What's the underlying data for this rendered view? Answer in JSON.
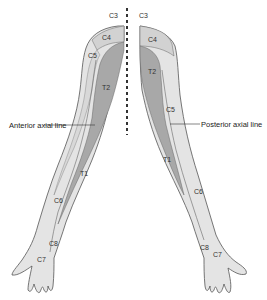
{
  "figure": {
    "colors": {
      "light": "#e4e4e4",
      "medium": "#c9c9c9",
      "dark": "#a8a8a8",
      "outline": "#555555",
      "divider": "#333333"
    },
    "annotations": {
      "anterior_axial_line": "Anterior axial line",
      "posterior_axial_line": "Posterior axial line"
    },
    "left_arm": {
      "view": "anterior",
      "labels": {
        "c3": "C3",
        "c4": "C4",
        "c5": "C5",
        "t2": "T2",
        "t1": "T1",
        "c6": "C6",
        "c8": "C8",
        "c7": "C7"
      }
    },
    "right_arm": {
      "view": "posterior",
      "labels": {
        "c3": "C3",
        "c4": "C4",
        "c5": "C5",
        "t2": "T2",
        "t1": "T1",
        "c6": "C6",
        "c8": "C8",
        "c7": "C7"
      }
    }
  }
}
